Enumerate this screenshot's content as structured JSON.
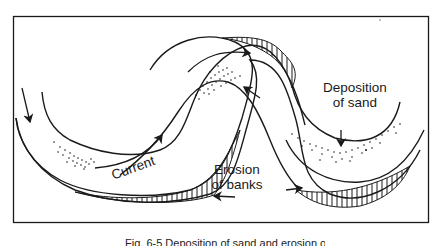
{
  "figure": {
    "labels": {
      "current": "Current",
      "erosion_line1": "Erosion",
      "erosion_line2": "of banks",
      "deposition_line1": "Deposition",
      "deposition_line2": "of sand"
    },
    "caption": "Fig. 6-5  Deposition of sand and erosion of banks in a meandering river",
    "colors": {
      "ink": "#1a1a1a",
      "background": "#ffffff"
    },
    "icons": {
      "flow_arrows": "arrow-icon",
      "sand": "stipple-dots",
      "eroded_bank": "vertical-hatching"
    }
  }
}
